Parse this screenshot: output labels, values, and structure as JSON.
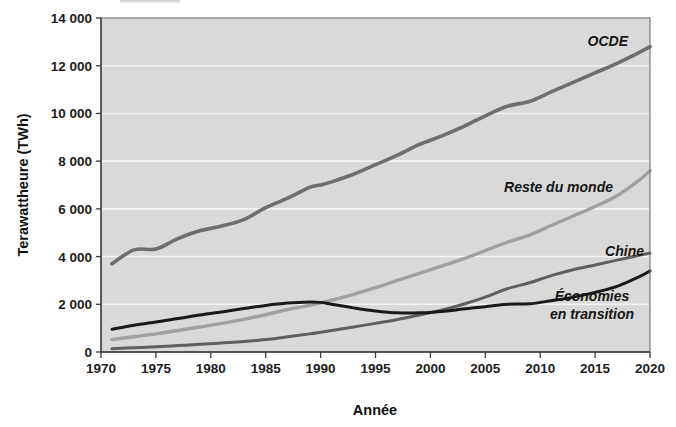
{
  "chart_data": {
    "type": "line",
    "title": "",
    "xlabel": "Année",
    "ylabel": "Terawattheure (TWh)",
    "xlim": [
      1970,
      2020
    ],
    "ylim": [
      0,
      14000
    ],
    "grid": true,
    "legend_position": "inline-annotations",
    "x_tick_labels": [
      "1970",
      "1975",
      "1980",
      "1985",
      "1990",
      "1995",
      "2000",
      "2005",
      "2010",
      "2015",
      "2020"
    ],
    "x_ticks": [
      1970,
      1975,
      1980,
      1985,
      1990,
      1995,
      2000,
      2005,
      2010,
      2015,
      2020
    ],
    "y_tick_labels": [
      "0",
      "2 000",
      "4 000",
      "6 000",
      "8 000",
      "10 000",
      "12 000",
      "14 000"
    ],
    "y_ticks": [
      0,
      2000,
      4000,
      6000,
      8000,
      10000,
      12000,
      14000
    ],
    "x": [
      1971,
      1973,
      1975,
      1977,
      1979,
      1981,
      1983,
      1985,
      1987,
      1989,
      1990,
      1991,
      1993,
      1995,
      1997,
      1999,
      2001,
      2003,
      2005,
      2007,
      2009,
      2011,
      2013,
      2015,
      2017,
      2019,
      2020
    ],
    "series": [
      {
        "name": "OCDE",
        "color": "#6e6e6e",
        "width": 3.6,
        "label": "OCDE",
        "values": [
          3700,
          4280,
          4320,
          4750,
          5080,
          5280,
          5550,
          6050,
          6450,
          6900,
          7000,
          7130,
          7450,
          7850,
          8250,
          8700,
          9050,
          9450,
          9900,
          10300,
          10500,
          10900,
          11300,
          11700,
          12100,
          12550,
          12800
        ]
      },
      {
        "name": "Reste du monde",
        "color": "#a0a0a0",
        "width": 3.4,
        "label": "Reste du monde",
        "values": [
          520,
          640,
          760,
          900,
          1050,
          1200,
          1370,
          1560,
          1780,
          1960,
          2050,
          2170,
          2420,
          2700,
          3000,
          3300,
          3600,
          3900,
          4250,
          4600,
          4900,
          5300,
          5700,
          6100,
          6550,
          7200,
          7600
        ]
      },
      {
        "name": "Chine",
        "color": "#5f5f5f",
        "width": 3.0,
        "label": "Chine",
        "values": [
          140,
          180,
          220,
          270,
          320,
          380,
          440,
          520,
          640,
          760,
          830,
          900,
          1050,
          1200,
          1360,
          1550,
          1750,
          2000,
          2300,
          2650,
          2900,
          3200,
          3450,
          3650,
          3850,
          4050,
          4150
        ]
      },
      {
        "name": "Économies en transition",
        "color": "#1a1a1a",
        "width": 3.0,
        "label_line1": "Économies",
        "label_line2": "en transition",
        "values": [
          950,
          1120,
          1260,
          1400,
          1550,
          1680,
          1820,
          1950,
          2050,
          2100,
          2080,
          2000,
          1850,
          1720,
          1640,
          1640,
          1700,
          1800,
          1900,
          2000,
          2020,
          2150,
          2300,
          2500,
          2750,
          3150,
          3400
        ]
      }
    ],
    "annotations": [
      {
        "text": "OCDE",
        "x": 2013,
        "y": 13000
      },
      {
        "text": "Reste du monde",
        "x": 2006,
        "y": 7100
      },
      {
        "text": "Chine",
        "x": 2016,
        "y": 4600
      },
      {
        "text": "Économies en transition",
        "x": 2015,
        "y": 2350
      }
    ]
  },
  "axes": {
    "y_label": "Terawattheure (TWh)",
    "x_label": "Année",
    "y_ticks": [
      "14 000",
      "12 000",
      "10 000",
      "8 000",
      "6 000",
      "4 000",
      "2 000",
      "0"
    ],
    "x_ticks": [
      "1970",
      "1975",
      "1980",
      "1985",
      "1990",
      "1995",
      "2000",
      "2005",
      "2010",
      "2015",
      "2020"
    ]
  },
  "labels": {
    "ocde": "OCDE",
    "reste_du_monde": "Reste du monde",
    "chine": "Chine",
    "economies_line1": "Économies",
    "economies_line2": "en transition"
  },
  "colors": {
    "plot_background": "#d9d9d9",
    "gridline": "#f4f4f4",
    "ocde": "#6e6e6e",
    "reste_du_monde": "#a0a0a0",
    "chine": "#5f5f5f",
    "economies_en_transition": "#1a1a1a",
    "axis": "#3a3a3a",
    "text": "#1a1a1a"
  }
}
